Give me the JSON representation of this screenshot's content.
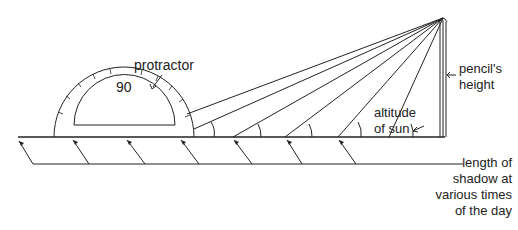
{
  "labels": {
    "protractor": "protractor",
    "protractor_mark": "90",
    "pencil_height_line1": "pencil's",
    "pencil_height_line2": "height",
    "altitude_line1": "altitude",
    "altitude_line2": "of sun",
    "shadow_line1": "length of",
    "shadow_line2": "shadow at",
    "shadow_line3": "various times",
    "shadow_line4": "of the day"
  },
  "colors": {
    "stroke": "#222222",
    "background": "#ffffff"
  }
}
